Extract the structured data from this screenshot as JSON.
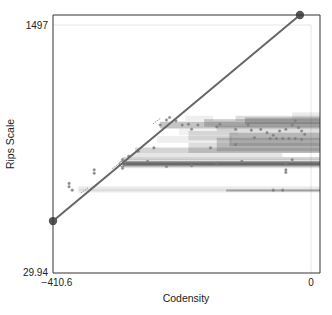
{
  "chart_data": {
    "type": "scatter",
    "title": "",
    "xlabel": "Codensity",
    "ylabel": "Rips Scale",
    "xlim": [
      -410.6,
      0
    ],
    "ylim": [
      29.94,
      1497
    ],
    "x_ticks": [
      {
        "value": -410.6,
        "label": "−410.6"
      },
      {
        "value": 0,
        "label": "0"
      }
    ],
    "y_ticks": [
      {
        "value": 29.94,
        "label": "29.94"
      },
      {
        "value": 1497,
        "label": "1497"
      }
    ],
    "grid": false,
    "legend": null,
    "line": {
      "name": "diagonal",
      "color": "#666666",
      "points": [
        {
          "x": -410.6,
          "y": 337
        },
        {
          "x": -17.6,
          "y": 1556
        }
      ]
    },
    "bars": [
      {
        "x0": -370,
        "x1": 0,
        "y0": 506,
        "y1": 542,
        "shade": 0.12
      },
      {
        "x0": -370,
        "x1": 0,
        "y0": 515,
        "y1": 527,
        "shade": 0.08
      },
      {
        "x0": -135,
        "x1": 0,
        "y0": 512,
        "y1": 524,
        "shade": 0.45
      },
      {
        "x0": -300,
        "x1": 0,
        "y0": 650,
        "y1": 704,
        "shade": 0.18
      },
      {
        "x0": -300,
        "x1": 0,
        "y0": 660,
        "y1": 692,
        "shade": 0.55
      },
      {
        "x0": -300,
        "x1": 0,
        "y0": 668,
        "y1": 684,
        "shade": 0.7
      },
      {
        "x0": -300,
        "x1": 0,
        "y0": 700,
        "y1": 716,
        "shade": 0.25
      },
      {
        "x0": -285,
        "x1": -60,
        "y0": 716,
        "y1": 740,
        "shade": 0.15
      },
      {
        "x0": -280,
        "x1": 0,
        "y0": 740,
        "y1": 772,
        "shade": 0.25
      },
      {
        "x0": -195,
        "x1": 0,
        "y0": 740,
        "y1": 800,
        "shade": 0.2
      },
      {
        "x0": -150,
        "x1": 0,
        "y0": 750,
        "y1": 830,
        "shade": 0.28
      },
      {
        "x0": -130,
        "x1": 0,
        "y0": 780,
        "y1": 860,
        "shade": 0.3
      },
      {
        "x0": -195,
        "x1": 0,
        "y0": 815,
        "y1": 870,
        "shade": 0.18
      },
      {
        "x0": -245,
        "x1": -140,
        "y0": 800,
        "y1": 840,
        "shade": 0.1
      },
      {
        "x0": -150,
        "x1": 0,
        "y0": 870,
        "y1": 900,
        "shade": 0.2
      },
      {
        "x0": -210,
        "x1": -130,
        "y0": 845,
        "y1": 885,
        "shade": 0.08
      },
      {
        "x0": -240,
        "x1": 0,
        "y0": 885,
        "y1": 925,
        "shade": 0.35
      },
      {
        "x0": -170,
        "x1": 0,
        "y0": 895,
        "y1": 940,
        "shade": 0.3
      },
      {
        "x0": -105,
        "x1": 0,
        "y0": 910,
        "y1": 950,
        "shade": 0.35
      },
      {
        "x0": -200,
        "x1": -170,
        "y0": 930,
        "y1": 960,
        "shade": 0.1
      },
      {
        "x0": -120,
        "x1": 0,
        "y0": 930,
        "y1": 960,
        "shade": 0.2
      },
      {
        "x0": -30,
        "x1": 0,
        "y0": 940,
        "y1": 980,
        "shade": 0.12
      }
    ],
    "points": [
      {
        "x": -300,
        "y": 676,
        "size": "medium"
      },
      {
        "x": -240,
        "y": 905
      },
      {
        "x": -230,
        "y": 935
      },
      {
        "x": -225,
        "y": 950
      },
      {
        "x": -215,
        "y": 930
      },
      {
        "x": -205,
        "y": 905
      },
      {
        "x": -195,
        "y": 910
      },
      {
        "x": -190,
        "y": 880
      },
      {
        "x": -180,
        "y": 905
      },
      {
        "x": -150,
        "y": 895
      },
      {
        "x": -145,
        "y": 910
      },
      {
        "x": -120,
        "y": 880
      },
      {
        "x": -100,
        "y": 905
      },
      {
        "x": -95,
        "y": 875
      },
      {
        "x": -80,
        "y": 880
      },
      {
        "x": -70,
        "y": 860
      },
      {
        "x": -60,
        "y": 845
      },
      {
        "x": -50,
        "y": 870
      },
      {
        "x": -40,
        "y": 880
      },
      {
        "x": -30,
        "y": 905
      },
      {
        "x": -25,
        "y": 930
      },
      {
        "x": -20,
        "y": 890
      },
      {
        "x": -15,
        "y": 870
      },
      {
        "x": -10,
        "y": 850
      },
      {
        "x": -65,
        "y": 825
      },
      {
        "x": -55,
        "y": 825
      },
      {
        "x": -45,
        "y": 825
      },
      {
        "x": -35,
        "y": 825
      },
      {
        "x": -25,
        "y": 825
      },
      {
        "x": -15,
        "y": 820
      },
      {
        "x": -90,
        "y": 830
      },
      {
        "x": -120,
        "y": 790
      },
      {
        "x": -160,
        "y": 770
      },
      {
        "x": -250,
        "y": 770
      },
      {
        "x": -275,
        "y": 750
      },
      {
        "x": -290,
        "y": 720
      },
      {
        "x": -300,
        "y": 700
      },
      {
        "x": -300,
        "y": 650
      },
      {
        "x": -260,
        "y": 690
      },
      {
        "x": -230,
        "y": 660
      },
      {
        "x": -190,
        "y": 665
      },
      {
        "x": -150,
        "y": 680
      },
      {
        "x": -110,
        "y": 690
      },
      {
        "x": -40,
        "y": 680
      },
      {
        "x": -30,
        "y": 700
      },
      {
        "x": -40,
        "y": 640
      },
      {
        "x": -40,
        "y": 625
      },
      {
        "x": -45,
        "y": 520
      },
      {
        "x": -60,
        "y": 520
      },
      {
        "x": -380,
        "y": 520
      },
      {
        "x": -385,
        "y": 540
      },
      {
        "x": -385,
        "y": 560
      },
      {
        "x": -345,
        "y": 620
      },
      {
        "x": -345,
        "y": 640
      }
    ],
    "dash_marks": [
      {
        "x": -360,
        "y": 520
      },
      {
        "x": -345,
        "y": 545
      },
      {
        "x": -310,
        "y": 665
      },
      {
        "x": -245,
        "y": 930
      }
    ]
  }
}
